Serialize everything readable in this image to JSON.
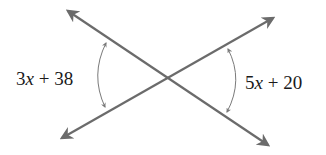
{
  "diagram": {
    "type": "intersecting-lines-vertical-angles",
    "colors": {
      "line": "#6b6b6b",
      "arc": "#7a7a7a",
      "text": "#1a1a1a",
      "background": "#ffffff"
    },
    "lines": [
      {
        "name": "line-descending",
        "from": [
          68,
          11
        ],
        "to": [
          268,
          145
        ],
        "arrows": "both"
      },
      {
        "name": "line-ascending",
        "from": [
          62,
          138
        ],
        "to": [
          273,
          18
        ],
        "arrows": "both"
      }
    ],
    "intersection": [
      167,
      78
    ],
    "angles": [
      {
        "position": "left",
        "label": {
          "coef": "3",
          "var": "x",
          "rest": " + 38"
        },
        "expression": "3x + 38"
      },
      {
        "position": "right",
        "label": {
          "coef": "5",
          "var": "x",
          "rest": " + 20"
        },
        "expression": "5x + 20"
      }
    ]
  }
}
